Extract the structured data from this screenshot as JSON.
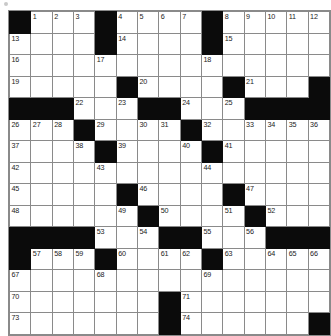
{
  "puzzle": {
    "title": "Crossword Grid",
    "type": "crossword",
    "rows": 15,
    "cols": 15,
    "colors": {
      "block": "#0b0b0b",
      "cell": "#ffffff",
      "gridline": "#8a8a8a",
      "number": "#1a1a1a"
    },
    "grid": [
      [
        {
          "block": true,
          "num": ""
        },
        {
          "block": false,
          "num": "1"
        },
        {
          "block": false,
          "num": "2"
        },
        {
          "block": false,
          "num": "3"
        },
        {
          "block": true,
          "num": ""
        },
        {
          "block": false,
          "num": "4"
        },
        {
          "block": false,
          "num": "5"
        },
        {
          "block": false,
          "num": "6"
        },
        {
          "block": false,
          "num": "7"
        },
        {
          "block": true,
          "num": ""
        },
        {
          "block": false,
          "num": "8"
        },
        {
          "block": false,
          "num": "9"
        },
        {
          "block": false,
          "num": "10"
        },
        {
          "block": false,
          "num": "11"
        },
        {
          "block": false,
          "num": "12"
        }
      ],
      [
        {
          "block": false,
          "num": "13"
        },
        {
          "block": false,
          "num": ""
        },
        {
          "block": false,
          "num": ""
        },
        {
          "block": false,
          "num": ""
        },
        {
          "block": true,
          "num": ""
        },
        {
          "block": false,
          "num": "14"
        },
        {
          "block": false,
          "num": ""
        },
        {
          "block": false,
          "num": ""
        },
        {
          "block": false,
          "num": ""
        },
        {
          "block": true,
          "num": ""
        },
        {
          "block": false,
          "num": "15"
        },
        {
          "block": false,
          "num": ""
        },
        {
          "block": false,
          "num": ""
        },
        {
          "block": false,
          "num": ""
        },
        {
          "block": false,
          "num": ""
        }
      ],
      [
        {
          "block": false,
          "num": "16"
        },
        {
          "block": false,
          "num": ""
        },
        {
          "block": false,
          "num": ""
        },
        {
          "block": false,
          "num": ""
        },
        {
          "block": false,
          "num": "17"
        },
        {
          "block": false,
          "num": ""
        },
        {
          "block": false,
          "num": ""
        },
        {
          "block": false,
          "num": ""
        },
        {
          "block": false,
          "num": ""
        },
        {
          "block": false,
          "num": "18"
        },
        {
          "block": false,
          "num": ""
        },
        {
          "block": false,
          "num": ""
        },
        {
          "block": false,
          "num": ""
        },
        {
          "block": false,
          "num": ""
        },
        {
          "block": false,
          "num": ""
        }
      ],
      [
        {
          "block": false,
          "num": "19"
        },
        {
          "block": false,
          "num": ""
        },
        {
          "block": false,
          "num": ""
        },
        {
          "block": false,
          "num": ""
        },
        {
          "block": false,
          "num": ""
        },
        {
          "block": true,
          "num": ""
        },
        {
          "block": false,
          "num": "20"
        },
        {
          "block": false,
          "num": ""
        },
        {
          "block": false,
          "num": ""
        },
        {
          "block": false,
          "num": ""
        },
        {
          "block": true,
          "num": ""
        },
        {
          "block": false,
          "num": "21"
        },
        {
          "block": false,
          "num": ""
        },
        {
          "block": false,
          "num": ""
        },
        {
          "block": true,
          "num": ""
        }
      ],
      [
        {
          "block": true,
          "num": ""
        },
        {
          "block": true,
          "num": ""
        },
        {
          "block": true,
          "num": ""
        },
        {
          "block": false,
          "num": "22"
        },
        {
          "block": false,
          "num": ""
        },
        {
          "block": false,
          "num": "23"
        },
        {
          "block": true,
          "num": ""
        },
        {
          "block": true,
          "num": ""
        },
        {
          "block": false,
          "num": "24"
        },
        {
          "block": false,
          "num": ""
        },
        {
          "block": false,
          "num": "25"
        },
        {
          "block": true,
          "num": ""
        },
        {
          "block": true,
          "num": ""
        },
        {
          "block": true,
          "num": ""
        },
        {
          "block": true,
          "num": ""
        }
      ],
      [
        {
          "block": false,
          "num": "26"
        },
        {
          "block": false,
          "num": "27"
        },
        {
          "block": false,
          "num": "28"
        },
        {
          "block": true,
          "num": ""
        },
        {
          "block": false,
          "num": "29"
        },
        {
          "block": false,
          "num": ""
        },
        {
          "block": false,
          "num": "30"
        },
        {
          "block": false,
          "num": "31"
        },
        {
          "block": true,
          "num": ""
        },
        {
          "block": false,
          "num": "32"
        },
        {
          "block": false,
          "num": ""
        },
        {
          "block": false,
          "num": "33"
        },
        {
          "block": false,
          "num": "34"
        },
        {
          "block": false,
          "num": "35"
        },
        {
          "block": false,
          "num": "36"
        }
      ],
      [
        {
          "block": false,
          "num": "37"
        },
        {
          "block": false,
          "num": ""
        },
        {
          "block": false,
          "num": ""
        },
        {
          "block": false,
          "num": "38"
        },
        {
          "block": true,
          "num": ""
        },
        {
          "block": false,
          "num": "39"
        },
        {
          "block": false,
          "num": ""
        },
        {
          "block": false,
          "num": ""
        },
        {
          "block": false,
          "num": "40"
        },
        {
          "block": true,
          "num": ""
        },
        {
          "block": false,
          "num": "41"
        },
        {
          "block": false,
          "num": ""
        },
        {
          "block": false,
          "num": ""
        },
        {
          "block": false,
          "num": ""
        },
        {
          "block": false,
          "num": ""
        }
      ],
      [
        {
          "block": false,
          "num": "42"
        },
        {
          "block": false,
          "num": ""
        },
        {
          "block": false,
          "num": ""
        },
        {
          "block": false,
          "num": ""
        },
        {
          "block": false,
          "num": "43"
        },
        {
          "block": false,
          "num": ""
        },
        {
          "block": false,
          "num": ""
        },
        {
          "block": false,
          "num": ""
        },
        {
          "block": false,
          "num": ""
        },
        {
          "block": false,
          "num": "44"
        },
        {
          "block": false,
          "num": ""
        },
        {
          "block": false,
          "num": ""
        },
        {
          "block": false,
          "num": ""
        },
        {
          "block": false,
          "num": ""
        },
        {
          "block": false,
          "num": ""
        }
      ],
      [
        {
          "block": false,
          "num": "45"
        },
        {
          "block": false,
          "num": ""
        },
        {
          "block": false,
          "num": ""
        },
        {
          "block": false,
          "num": ""
        },
        {
          "block": false,
          "num": ""
        },
        {
          "block": true,
          "num": ""
        },
        {
          "block": false,
          "num": "46"
        },
        {
          "block": false,
          "num": ""
        },
        {
          "block": false,
          "num": ""
        },
        {
          "block": false,
          "num": ""
        },
        {
          "block": true,
          "num": ""
        },
        {
          "block": false,
          "num": "47"
        },
        {
          "block": false,
          "num": ""
        },
        {
          "block": false,
          "num": ""
        },
        {
          "block": false,
          "num": ""
        }
      ],
      [
        {
          "block": false,
          "num": "48"
        },
        {
          "block": false,
          "num": ""
        },
        {
          "block": false,
          "num": ""
        },
        {
          "block": false,
          "num": ""
        },
        {
          "block": false,
          "num": ""
        },
        {
          "block": false,
          "num": "49"
        },
        {
          "block": true,
          "num": ""
        },
        {
          "block": false,
          "num": "50"
        },
        {
          "block": false,
          "num": ""
        },
        {
          "block": false,
          "num": ""
        },
        {
          "block": false,
          "num": "51"
        },
        {
          "block": true,
          "num": ""
        },
        {
          "block": false,
          "num": "52"
        },
        {
          "block": false,
          "num": ""
        },
        {
          "block": false,
          "num": ""
        }
      ],
      [
        {
          "block": true,
          "num": ""
        },
        {
          "block": true,
          "num": ""
        },
        {
          "block": true,
          "num": ""
        },
        {
          "block": true,
          "num": ""
        },
        {
          "block": false,
          "num": "53"
        },
        {
          "block": false,
          "num": ""
        },
        {
          "block": false,
          "num": "54"
        },
        {
          "block": true,
          "num": ""
        },
        {
          "block": true,
          "num": ""
        },
        {
          "block": false,
          "num": "55"
        },
        {
          "block": false,
          "num": ""
        },
        {
          "block": false,
          "num": "56"
        },
        {
          "block": true,
          "num": ""
        },
        {
          "block": true,
          "num": ""
        },
        {
          "block": true,
          "num": ""
        }
      ],
      [
        {
          "block": true,
          "num": ""
        },
        {
          "block": false,
          "num": "57"
        },
        {
          "block": false,
          "num": "58"
        },
        {
          "block": false,
          "num": "59"
        },
        {
          "block": true,
          "num": ""
        },
        {
          "block": false,
          "num": "60"
        },
        {
          "block": false,
          "num": ""
        },
        {
          "block": false,
          "num": "61"
        },
        {
          "block": false,
          "num": "62"
        },
        {
          "block": true,
          "num": ""
        },
        {
          "block": false,
          "num": "63"
        },
        {
          "block": false,
          "num": ""
        },
        {
          "block": false,
          "num": "64"
        },
        {
          "block": false,
          "num": "65"
        },
        {
          "block": false,
          "num": "66"
        }
      ],
      [
        {
          "block": false,
          "num": "67"
        },
        {
          "block": false,
          "num": ""
        },
        {
          "block": false,
          "num": ""
        },
        {
          "block": false,
          "num": ""
        },
        {
          "block": false,
          "num": "68"
        },
        {
          "block": false,
          "num": ""
        },
        {
          "block": false,
          "num": ""
        },
        {
          "block": false,
          "num": ""
        },
        {
          "block": false,
          "num": ""
        },
        {
          "block": false,
          "num": "69"
        },
        {
          "block": false,
          "num": ""
        },
        {
          "block": false,
          "num": ""
        },
        {
          "block": false,
          "num": ""
        },
        {
          "block": false,
          "num": ""
        },
        {
          "block": false,
          "num": ""
        }
      ],
      [
        {
          "block": false,
          "num": "70"
        },
        {
          "block": false,
          "num": ""
        },
        {
          "block": false,
          "num": ""
        },
        {
          "block": false,
          "num": ""
        },
        {
          "block": false,
          "num": ""
        },
        {
          "block": false,
          "num": ""
        },
        {
          "block": false,
          "num": ""
        },
        {
          "block": true,
          "num": ""
        },
        {
          "block": false,
          "num": "71"
        },
        {
          "block": false,
          "num": ""
        },
        {
          "block": false,
          "num": ""
        },
        {
          "block": false,
          "num": ""
        },
        {
          "block": false,
          "num": ""
        },
        {
          "block": false,
          "num": ""
        },
        {
          "block": false,
          "num": ""
        }
      ],
      [
        {
          "block": false,
          "num": "73"
        },
        {
          "block": false,
          "num": ""
        },
        {
          "block": false,
          "num": ""
        },
        {
          "block": false,
          "num": ""
        },
        {
          "block": false,
          "num": ""
        },
        {
          "block": false,
          "num": ""
        },
        {
          "block": false,
          "num": ""
        },
        {
          "block": true,
          "num": ""
        },
        {
          "block": false,
          "num": "74"
        },
        {
          "block": false,
          "num": ""
        },
        {
          "block": false,
          "num": ""
        },
        {
          "block": false,
          "num": ""
        },
        {
          "block": false,
          "num": ""
        },
        {
          "block": false,
          "num": ""
        },
        {
          "block": true,
          "num": ""
        }
      ]
    ]
  }
}
